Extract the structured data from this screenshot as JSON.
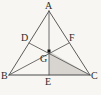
{
  "figure": {
    "background_color": "#f7f6f2",
    "line_color": "#4a4a4a",
    "shade_color": "#d8d5d0",
    "label_color": "#2b2b2b"
  },
  "points": {
    "A": {
      "label": "A",
      "x": 49,
      "y": 11,
      "label_x": 45,
      "label_y": 1
    },
    "B": {
      "label": "B",
      "x": 9,
      "y": 75,
      "label_x": 1,
      "label_y": 71
    },
    "C": {
      "label": "C",
      "x": 90,
      "y": 75,
      "label_x": 91,
      "label_y": 71
    },
    "D": {
      "label": "D",
      "x": 29,
      "y": 43,
      "label_x": 21,
      "label_y": 33
    },
    "E": {
      "label": "E",
      "x": 49,
      "y": 75,
      "label_x": 45,
      "label_y": 77
    },
    "F": {
      "label": "F",
      "x": 69,
      "y": 43,
      "label_x": 69,
      "label_y": 33
    },
    "G": {
      "label": "G",
      "x": 49,
      "y": 51,
      "label_x": 40,
      "label_y": 54
    }
  },
  "segments": [
    {
      "name": "side-AB",
      "from": "A",
      "to": "B"
    },
    {
      "name": "side-AC",
      "from": "A",
      "to": "C"
    },
    {
      "name": "side-BC",
      "from": "B",
      "to": "C"
    },
    {
      "name": "median-AE",
      "from": "A",
      "to": "E"
    },
    {
      "name": "median-BF",
      "from": "B",
      "to": "F"
    },
    {
      "name": "median-CD",
      "from": "C",
      "to": "D"
    }
  ],
  "shaded_region": {
    "name": "triangle-GEC",
    "vertices": [
      "G",
      "E",
      "C"
    ]
  },
  "centroid_marker": {
    "name": "centroid-point",
    "x": 49,
    "y": 51,
    "size": 3
  }
}
